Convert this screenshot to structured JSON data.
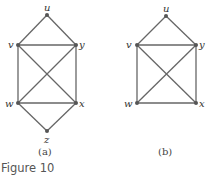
{
  "figure": {
    "caption": "Figure 10",
    "colors": {
      "edge": "#666666",
      "node": "#555555",
      "label": "#333333",
      "caption": "#555555"
    }
  },
  "graphs": [
    {
      "id": "a",
      "sublabel": "(a)",
      "vertices": [
        {
          "name": "u",
          "x": 47,
          "y": 15
        },
        {
          "name": "v",
          "x": 18,
          "y": 45
        },
        {
          "name": "y",
          "x": 76,
          "y": 45
        },
        {
          "name": "w",
          "x": 18,
          "y": 103
        },
        {
          "name": "x",
          "x": 76,
          "y": 103
        },
        {
          "name": "z",
          "x": 47,
          "y": 131
        }
      ],
      "edges": [
        [
          "u",
          "v"
        ],
        [
          "u",
          "y"
        ],
        [
          "v",
          "y"
        ],
        [
          "v",
          "w"
        ],
        [
          "y",
          "x"
        ],
        [
          "v",
          "x"
        ],
        [
          "y",
          "w"
        ],
        [
          "w",
          "x"
        ],
        [
          "w",
          "z"
        ],
        [
          "x",
          "z"
        ]
      ]
    },
    {
      "id": "b",
      "sublabel": "(b)",
      "vertices": [
        {
          "name": "u",
          "x": 166,
          "y": 16
        },
        {
          "name": "v",
          "x": 137,
          "y": 45
        },
        {
          "name": "y",
          "x": 196,
          "y": 45
        },
        {
          "name": "w",
          "x": 137,
          "y": 103
        },
        {
          "name": "x",
          "x": 196,
          "y": 103
        }
      ],
      "edges": [
        [
          "u",
          "v"
        ],
        [
          "u",
          "y"
        ],
        [
          "v",
          "y"
        ],
        [
          "v",
          "w"
        ],
        [
          "y",
          "x"
        ],
        [
          "v",
          "x"
        ],
        [
          "y",
          "w"
        ],
        [
          "w",
          "x"
        ]
      ]
    }
  ]
}
